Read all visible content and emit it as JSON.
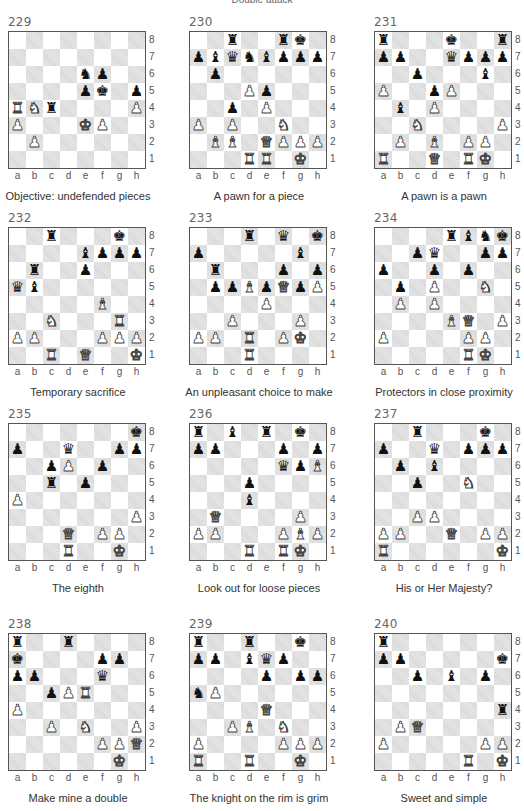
{
  "page": {
    "top_caption": "Double attack"
  },
  "files": [
    "a",
    "b",
    "c",
    "d",
    "e",
    "f",
    "g",
    "h"
  ],
  "ranks": [
    "8",
    "7",
    "6",
    "5",
    "4",
    "3",
    "2",
    "1"
  ],
  "piece_glyphs": {
    "K": "♚",
    "Q": "♛",
    "R": "♜",
    "B": "♝",
    "N": "♞",
    "P": "♟"
  },
  "diagrams": [
    {
      "number": "229",
      "caption": "Objective: undefended pieces",
      "pos": {
        "x": 8,
        "y": 15
      },
      "white": [
        "Ra4",
        "Nb4",
        "Pa3",
        "Pb2",
        "Ke3",
        "Pf3",
        "Ph4"
      ],
      "black": [
        "Rc4",
        "Ne6",
        "Pf6",
        "Pe5",
        "Kf5",
        "Ph5"
      ]
    },
    {
      "number": "230",
      "caption": "A pawn for a piece",
      "pos": {
        "x": 189,
        "y": 15
      },
      "white": [
        "Pd5",
        "Pe4",
        "Pa3",
        "Pc3",
        "Nf3",
        "Bb2",
        "Bc2",
        "Qe2",
        "Pf2",
        "Pg2",
        "Ph2",
        "Rd1",
        "Re1",
        "Kg1"
      ],
      "black": [
        "Rc8",
        "Rf8",
        "Kg8",
        "Pa7",
        "Bb7",
        "Qc7",
        "Nd7",
        "Be7",
        "Pf7",
        "Pg7",
        "Ph7",
        "Pb6",
        "Pe5",
        "Pc4"
      ]
    },
    {
      "number": "231",
      "caption": "A pawn is a pawn",
      "pos": {
        "x": 374,
        "y": 15
      },
      "white": [
        "Pa5",
        "Pe5",
        "Pd4",
        "Nc3",
        "Ph3",
        "Pb2",
        "Bd2",
        "Pf2",
        "Pg2",
        "Ra1",
        "Qd1",
        "Rf1",
        "Kg1"
      ],
      "black": [
        "Ra8",
        "Ke8",
        "Rh8",
        "Pa7",
        "Pb7",
        "Qe7",
        "Pf7",
        "Pg7",
        "Ph7",
        "Pc6",
        "Bg6",
        "Pd5",
        "Bb4"
      ]
    },
    {
      "number": "232",
      "caption": "Temporary sacrifice",
      "pos": {
        "x": 8,
        "y": 211
      },
      "white": [
        "Bf4",
        "Nc3",
        "Rg3",
        "Pa2",
        "Pb2",
        "Pf2",
        "Pg2",
        "Ph2",
        "Rc1",
        "Qe1",
        "Kh1"
      ],
      "black": [
        "Rc8",
        "Kg8",
        "Be7",
        "Pf7",
        "Pg7",
        "Ph7",
        "Rb6",
        "Pe6",
        "Qa5",
        "Bb5"
      ]
    },
    {
      "number": "233",
      "caption": "An unpleasant choice to make",
      "pos": {
        "x": 189,
        "y": 211
      },
      "white": [
        "Bd5",
        "Qf5",
        "Ph5",
        "Pe4",
        "Pc3",
        "Pg3",
        "Pa2",
        "Pb2",
        "Rd2",
        "Pf2",
        "Kg2",
        "Rd1"
      ],
      "black": [
        "Rd8",
        "Qf8",
        "Kh8",
        "Pa7",
        "Bg7",
        "Rb6",
        "Pf6",
        "Ph6",
        "Pb5",
        "Pc5",
        "Pe5",
        "Pg5"
      ]
    },
    {
      "number": "234",
      "caption": "Protectors in close proximity",
      "pos": {
        "x": 374,
        "y": 211
      },
      "white": [
        "Pd5",
        "Ng5",
        "Pb4",
        "Pd4",
        "Be3",
        "Qf3",
        "Ph3",
        "Pa2",
        "Pf2",
        "Pg2",
        "Rf1",
        "Kg1"
      ],
      "black": [
        "Re8",
        "Bf8",
        "Ng8",
        "Kh8",
        "Pc7",
        "Qd7",
        "Pg7",
        "Ph7",
        "Pa6",
        "Pd6",
        "Pf6",
        "Pb5"
      ]
    },
    {
      "number": "235",
      "caption": "The eighth",
      "pos": {
        "x": 8,
        "y": 407
      },
      "white": [
        "Pd6",
        "Pa4",
        "Ph3",
        "Qd2",
        "Pf2",
        "Pg2",
        "Rd1",
        "Kg1"
      ],
      "black": [
        "Kh8",
        "Pa7",
        "Qd7",
        "Pg7",
        "Ph7",
        "Pc6",
        "Pf6",
        "Rc5",
        "Pe5"
      ]
    },
    {
      "number": "236",
      "caption": "Look out for loose pieces",
      "pos": {
        "x": 189,
        "y": 407
      },
      "white": [
        "Bh6",
        "Qb3",
        "Pg3",
        "Pa2",
        "Pb2",
        "Pf2",
        "Bg2",
        "Ph2",
        "Rd1",
        "Rf1",
        "Kg1"
      ],
      "black": [
        "Ra8",
        "Bc8",
        "Re8",
        "Kg8",
        "Pa7",
        "Pb7",
        "Pf7",
        "Ph7",
        "Qf6",
        "Pg6",
        "Pd5",
        "Bd4"
      ]
    },
    {
      "number": "237",
      "caption": "His or Her Majesty?",
      "pos": {
        "x": 374,
        "y": 407
      },
      "white": [
        "Nf5",
        "Pc3",
        "Pd3",
        "Pa2",
        "Pb2",
        "Qe2",
        "Pg2",
        "Ph2",
        "Ra1",
        "Kh1"
      ],
      "black": [
        "Rc8",
        "Kg8",
        "Pa7",
        "Qd7",
        "Pf7",
        "Pg7",
        "Ph7",
        "Pb6",
        "Bd6",
        "Pc5"
      ]
    },
    {
      "number": "238",
      "caption": "Make mine a double",
      "pos": {
        "x": 8,
        "y": 617
      },
      "white": [
        "Pd5",
        "Re5",
        "Pa4",
        "Pc3",
        "Ne3",
        "Ph3",
        "Pf2",
        "Pg2",
        "Qh2",
        "Kg1"
      ],
      "black": [
        "Ra8",
        "Rd8",
        "Ka7",
        "Pf7",
        "Pg7",
        "Pa6",
        "Pb6",
        "Qf6",
        "Pc5"
      ]
    },
    {
      "number": "239",
      "caption": "The knight on the rim is grim",
      "pos": {
        "x": 189,
        "y": 617
      },
      "white": [
        "Pb5",
        "Qe4",
        "Pc3",
        "Bd3",
        "Nf3",
        "Pa2",
        "Pf2",
        "Pg2",
        "Ph2",
        "Ra1",
        "Rd1",
        "Kg1"
      ],
      "black": [
        "Ra8",
        "Rd8",
        "Kg8",
        "Pa7",
        "Pb7",
        "Bd7",
        "Qe7",
        "Pf7",
        "Pe6",
        "Pg6",
        "Ph6",
        "Na5"
      ]
    },
    {
      "number": "240",
      "caption": "Sweet and simple",
      "pos": {
        "x": 374,
        "y": 617
      },
      "white": [
        "Pb3",
        "Qc3",
        "Pa2",
        "Pg2",
        "Ph2",
        "Rf1",
        "Kh1"
      ],
      "black": [
        "Ra8",
        "Pa7",
        "Pb7",
        "Kh7",
        "Pc6",
        "Be6",
        "Pg6",
        "Rh4"
      ]
    }
  ]
}
